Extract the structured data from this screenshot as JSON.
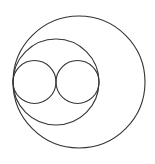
{
  "diagram": {
    "title": "",
    "background": "#ffffff",
    "stroke_color": "#333333",
    "stroke_width": 1.1,
    "circles": [
      {
        "id": "large-circle",
        "cx": 79,
        "cy": 82,
        "r": 66
      },
      {
        "id": "middle-circle",
        "cx": 56,
        "cy": 82,
        "r": 43
      },
      {
        "id": "small-circle-left",
        "cx": 34.5,
        "cy": 82,
        "r": 21.5
      },
      {
        "id": "small-circle-right",
        "cx": 77.5,
        "cy": 82,
        "r": 21.5
      }
    ],
    "common_tangent_point": {
      "x": 13,
      "y": 82
    }
  }
}
